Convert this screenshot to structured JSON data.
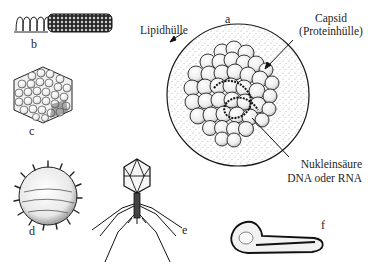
{
  "diagram": {
    "labels": {
      "a": "a",
      "b": "b",
      "c": "c",
      "d": "d",
      "e": "e",
      "f": "f"
    },
    "annotations": {
      "lipid_envelope": "Lipidhülle",
      "capsid_line1": "Capsid",
      "capsid_line2": "(Proteinhülle)",
      "nucleic_acid_line1": "Nukleinsäure",
      "nucleic_acid_line2": "DNA oder RNA"
    },
    "figures": [
      {
        "id": "a",
        "description": "Enveloped icosahedral virus with lipid envelope, capsid and nucleic acid"
      },
      {
        "id": "b",
        "description": "Helical rod-shaped virus with exposed nucleic acid coil"
      },
      {
        "id": "c",
        "description": "Icosahedral virus (hexagonal outline)"
      },
      {
        "id": "d",
        "description": "Spherical spiked virus"
      },
      {
        "id": "e",
        "description": "Bacteriophage with head, tail and tail fibers"
      },
      {
        "id": "f",
        "description": "Bullet/filament-shaped virus"
      }
    ],
    "colors": {
      "ink": "#1e1e1e",
      "background": "#ffffff",
      "stipple": "#555555",
      "capsomer_fill": "#f2f2f2"
    }
  }
}
